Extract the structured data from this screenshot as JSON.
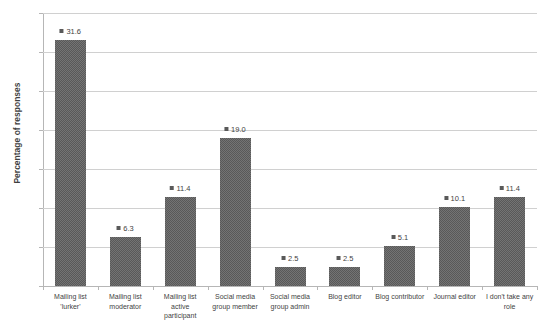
{
  "chart_data": {
    "type": "bar",
    "title": "Roles taken in communication methods",
    "xlabel": "",
    "ylabel": "Percentage of responses",
    "ylim": [
      0,
      35
    ],
    "yticks": [
      0,
      5,
      10,
      15,
      20,
      25,
      30,
      35
    ],
    "grid": true,
    "legend": false,
    "series_color": "#595959",
    "categories": [
      "Mailing list 'lurker'",
      "Mailing list moderator",
      "Mailing list active participant",
      "Social media group member",
      "Social media group admin",
      "Blog editor",
      "Blog contributor",
      "Journal editor",
      "I don't take any role"
    ],
    "category_lines": [
      [
        "Mailing list",
        "'lurker'"
      ],
      [
        "Mailing list",
        "moderator"
      ],
      [
        "Mailing list",
        "active",
        "participant"
      ],
      [
        "Social media",
        "group member"
      ],
      [
        "Social media",
        "group admin"
      ],
      [
        "Blog editor"
      ],
      [
        "Blog contributor"
      ],
      [
        "Journal editor"
      ],
      [
        "I don't take any",
        "role"
      ]
    ],
    "values": [
      31.6,
      6.3,
      11.4,
      19.0,
      2.5,
      2.5,
      5.1,
      10.1,
      11.4
    ],
    "data_labels": [
      "31.6",
      "6.3",
      "11.4",
      "19.0",
      "2.5",
      "2.5",
      "5.1",
      "10.1",
      "11.4"
    ],
    "ytick_labels": [
      "0",
      "5",
      "10",
      "15",
      "20",
      "25",
      "30",
      "35"
    ]
  }
}
